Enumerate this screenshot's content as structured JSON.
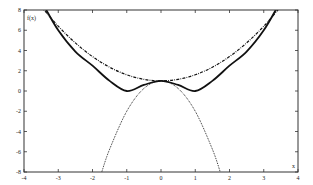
{
  "chart_data": {
    "type": "line",
    "title": "",
    "xlabel": "x",
    "ylabel": "f(x)",
    "xlim": [
      -4,
      4
    ],
    "ylim": [
      -8,
      8
    ],
    "grid": false,
    "legend": null,
    "x_ticks": [
      -4,
      -3,
      -2,
      -1,
      0,
      1,
      2,
      3,
      4
    ],
    "y_ticks": [
      -8,
      -6,
      -4,
      -2,
      0,
      2,
      4,
      6,
      8
    ],
    "x_tick_labels": [
      "-4",
      "-3",
      "-2",
      "-1",
      "0",
      "1",
      "2",
      "3",
      "4"
    ],
    "y_tick_labels": [
      "-8",
      "-6",
      "-4",
      "-2",
      "0",
      "2",
      "4",
      "6",
      "8"
    ],
    "series": [
      {
        "name": "solid",
        "style": "solid",
        "color": "#111111",
        "x": [
          -3.4,
          -3.0,
          -2.5,
          -2.0,
          -1.5,
          -1.0,
          -0.5,
          0.0,
          0.5,
          1.0,
          1.5,
          2.0,
          2.5,
          3.0,
          3.4
        ],
        "y": [
          8.3,
          6.0,
          3.9,
          2.5,
          1.0,
          0.0,
          0.6,
          1.0,
          0.6,
          0.0,
          1.0,
          2.5,
          3.9,
          6.0,
          8.3
        ]
      },
      {
        "name": "dash-dot",
        "style": "dashdot",
        "color": "#111111",
        "x": [
          -3.5,
          -3.0,
          -2.5,
          -2.0,
          -1.5,
          -1.0,
          -0.5,
          0.0,
          0.5,
          1.0,
          1.5,
          2.0,
          2.5,
          3.0,
          3.5
        ],
        "y": [
          8.35,
          6.4,
          4.75,
          3.4,
          2.35,
          1.6,
          1.15,
          1.0,
          1.15,
          1.6,
          2.35,
          3.4,
          4.75,
          6.4,
          8.35
        ]
      },
      {
        "name": "dotted",
        "style": "dotted",
        "color": "#111111",
        "x": [
          -1.73,
          -1.5,
          -1.0,
          -0.5,
          0.0,
          0.5,
          1.0,
          1.5,
          1.73
        ],
        "y": [
          -8.0,
          -5.75,
          -2.0,
          0.25,
          1.0,
          0.25,
          -2.0,
          -5.75,
          -8.0
        ]
      }
    ]
  }
}
